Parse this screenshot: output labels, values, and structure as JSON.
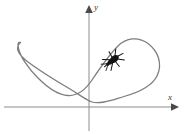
{
  "figure": {
    "kind": "parametric-curve-plot",
    "background_color": "#ffffff",
    "axes": {
      "color": "#8c8c8c",
      "stroke_width": 1,
      "x_axis": {
        "label": "x",
        "y_position": 107,
        "x_start": 4,
        "x_end": 176,
        "arrow": "right"
      },
      "y_axis": {
        "label": "y",
        "x_position": 89,
        "y_start": 8,
        "y_end": 131,
        "arrow": "up"
      },
      "origin": {
        "x": 89,
        "y": 107
      }
    },
    "curve": {
      "color": "#7e7e7e",
      "stroke_width": 1.3,
      "description": "self-intersecting parametric curve with a narrow elongated loop at upper-left and a large rounded loop at right, crossing itself near the origin",
      "path": "M 20.5 42.5 C 14.5 47.5 18 54.5 28 62 C 40 71 58 82 70 89 C 80 95 86 100 92 102 C 100 104.5 112 100 124 96.5 C 140 92 152 86 157 76 C 163 64 158 51 148 43.5 C 138 36 126 38 118 46 C 110 54 100 68 92 80 C 84 92 76 96 68 95.5 C 58 95 48 88 38 78 C 28 68 20 56 18.5 48.5 C 17.5 43.5 18 42 20.5 42.5 Z"
    },
    "bug": {
      "name": "bug-on-curve",
      "color": "#121212",
      "position": {
        "x": 113,
        "y": 60
      },
      "body_width": 12,
      "body_height": 7,
      "rotation_deg": -38,
      "legs": 8
    }
  }
}
